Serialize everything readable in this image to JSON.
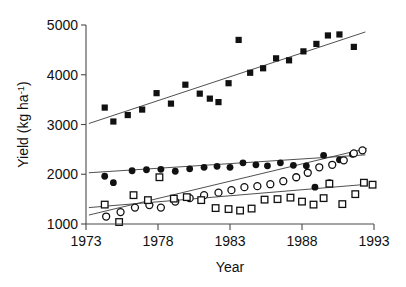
{
  "chart_data": {
    "type": "scatter",
    "title": "",
    "xlabel": "Year",
    "ylabel": "Yield (kg ha-1)",
    "ylabel_base": "Yield (kg ha",
    "ylabel_sup": "-1",
    "ylabel_tail": ")",
    "xlim": [
      1973,
      1993
    ],
    "ylim": [
      1000,
      5000
    ],
    "grid": false,
    "legend": "none",
    "xticks": [
      1973,
      1978,
      1983,
      1988,
      1993
    ],
    "xtick_labels": [
      "1973",
      "1978",
      "1983",
      "1988",
      "1993"
    ],
    "yticks": [
      1000,
      2000,
      3000,
      4000,
      5000
    ],
    "ytick_labels": [
      "1000",
      "2000",
      "3000",
      "4000",
      "5000"
    ],
    "series": [
      {
        "name": "filled-squares",
        "marker": "filled-square",
        "points": [
          [
            1974.3,
            3340
          ],
          [
            1974.9,
            3060
          ],
          [
            1975.9,
            3190
          ],
          [
            1976.9,
            3300
          ],
          [
            1977.9,
            3630
          ],
          [
            1978.9,
            3420
          ],
          [
            1979.9,
            3800
          ],
          [
            1980.9,
            3620
          ],
          [
            1981.6,
            3520
          ],
          [
            1982.2,
            3450
          ],
          [
            1982.9,
            3830
          ],
          [
            1983.6,
            4700
          ],
          [
            1984.4,
            4040
          ],
          [
            1985.3,
            4130
          ],
          [
            1986.2,
            4330
          ],
          [
            1987.1,
            4290
          ],
          [
            1988.1,
            4470
          ],
          [
            1989.0,
            4620
          ],
          [
            1989.8,
            4790
          ],
          [
            1990.6,
            4810
          ],
          [
            1991.6,
            4560
          ]
        ],
        "trend": {
          "x0": 1973.2,
          "y0": 3020,
          "x1": 1992.4,
          "y1": 4860
        }
      },
      {
        "name": "filled-circles",
        "marker": "filled-circle",
        "points": [
          [
            1974.3,
            1960
          ],
          [
            1974.9,
            1830
          ],
          [
            1976.2,
            2070
          ],
          [
            1977.2,
            2090
          ],
          [
            1978.2,
            2100
          ],
          [
            1979.2,
            2060
          ],
          [
            1980.2,
            2110
          ],
          [
            1981.2,
            2140
          ],
          [
            1982.1,
            2160
          ],
          [
            1983.0,
            2140
          ],
          [
            1983.9,
            2230
          ],
          [
            1984.8,
            2190
          ],
          [
            1985.6,
            2170
          ],
          [
            1986.5,
            2230
          ],
          [
            1987.4,
            2180
          ],
          [
            1988.3,
            2170
          ],
          [
            1988.9,
            1740
          ],
          [
            1989.5,
            2380
          ],
          [
            1989.9,
            1830
          ],
          [
            1990.6,
            2290
          ],
          [
            1991.5,
            2400
          ]
        ],
        "trend": {
          "x0": 1973.2,
          "y0": 2030,
          "x1": 1992.4,
          "y1": 2390
        }
      },
      {
        "name": "open-circles",
        "marker": "open-circle",
        "points": [
          [
            1974.4,
            1150
          ],
          [
            1975.4,
            1240
          ],
          [
            1976.4,
            1330
          ],
          [
            1977.4,
            1380
          ],
          [
            1978.2,
            1330
          ],
          [
            1979.2,
            1450
          ],
          [
            1980.2,
            1520
          ],
          [
            1981.2,
            1580
          ],
          [
            1982.2,
            1630
          ],
          [
            1983.1,
            1680
          ],
          [
            1984.0,
            1740
          ],
          [
            1984.9,
            1760
          ],
          [
            1985.8,
            1800
          ],
          [
            1986.7,
            1860
          ],
          [
            1987.6,
            1940
          ],
          [
            1988.4,
            2030
          ],
          [
            1989.2,
            2140
          ],
          [
            1990.1,
            2190
          ],
          [
            1990.9,
            2280
          ],
          [
            1991.6,
            2420
          ],
          [
            1992.2,
            2480
          ]
        ],
        "trend": {
          "x0": 1973.2,
          "y0": 1180,
          "x1": 1992.5,
          "y1": 2520
        }
      },
      {
        "name": "open-squares",
        "marker": "open-square",
        "points": [
          [
            1974.3,
            1390
          ],
          [
            1975.3,
            1040
          ],
          [
            1976.3,
            1580
          ],
          [
            1977.3,
            1480
          ],
          [
            1978.1,
            1940
          ],
          [
            1979.1,
            1510
          ],
          [
            1980.0,
            1540
          ],
          [
            1981.0,
            1480
          ],
          [
            1982.0,
            1320
          ],
          [
            1982.9,
            1300
          ],
          [
            1983.7,
            1270
          ],
          [
            1984.5,
            1310
          ],
          [
            1985.4,
            1490
          ],
          [
            1986.3,
            1500
          ],
          [
            1987.2,
            1530
          ],
          [
            1988.0,
            1450
          ],
          [
            1988.8,
            1390
          ],
          [
            1989.5,
            1520
          ],
          [
            1989.9,
            1810
          ],
          [
            1990.8,
            1400
          ],
          [
            1991.7,
            1600
          ],
          [
            1992.3,
            1830
          ],
          [
            1992.9,
            1790
          ]
        ],
        "trend": {
          "x0": 1973.2,
          "y0": 1330,
          "x1": 1992.6,
          "y1": 1800
        }
      }
    ]
  }
}
